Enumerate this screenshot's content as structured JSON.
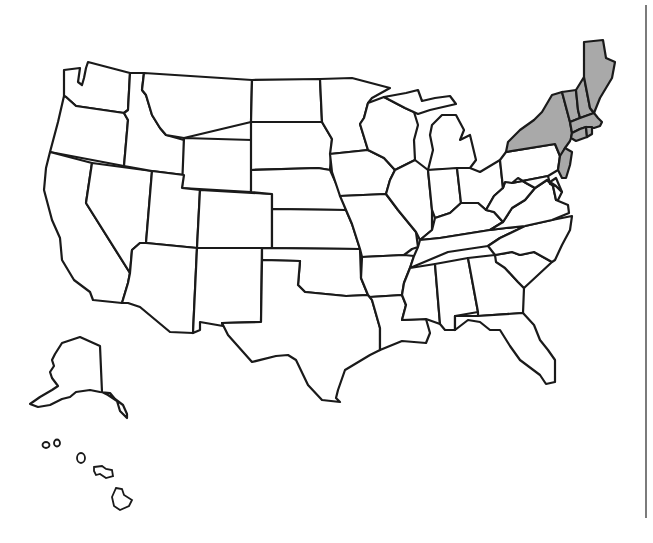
{
  "map": {
    "type": "us-states-outline",
    "highlight_color": "#a9a9a9",
    "base_color": "#ffffff",
    "stroke_color": "#1a1a1a",
    "highlighted_states": [
      "Maine",
      "New Hampshire",
      "Vermont",
      "Massachusetts",
      "Rhode Island",
      "Connecticut",
      "New York",
      "New Jersey"
    ],
    "insets": [
      "Alaska",
      "Hawaii"
    ]
  }
}
